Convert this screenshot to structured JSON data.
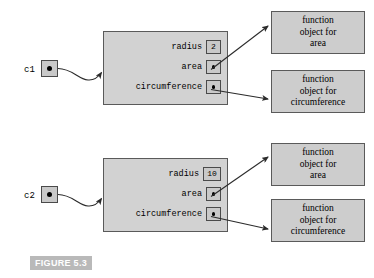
{
  "figure": {
    "caption": "FIGURE 5.3",
    "colors": {
      "object_box_fill": "#d2d2d2",
      "function_box_fill": "#cdcdcd",
      "slot_fill": "#c9c9c9",
      "border": "#5a5a5a",
      "caption_band": "#b9b9b9",
      "caption_text": "#ffffff",
      "line": "#2b2b2b",
      "dot": "#000000"
    }
  },
  "instances": [
    {
      "variable": "c1",
      "attributes": [
        {
          "name": "radius",
          "kind": "value",
          "value": "2"
        },
        {
          "name": "area",
          "kind": "pointer",
          "value": ""
        },
        {
          "name": "circumference",
          "kind": "pointer",
          "value": ""
        }
      ],
      "functions": [
        {
          "lines": [
            "function",
            "object for",
            "area"
          ]
        },
        {
          "lines": [
            "function",
            "object for",
            "circumference"
          ]
        }
      ]
    },
    {
      "variable": "c2",
      "attributes": [
        {
          "name": "radius",
          "kind": "value",
          "value": "10"
        },
        {
          "name": "area",
          "kind": "pointer",
          "value": ""
        },
        {
          "name": "circumference",
          "kind": "pointer",
          "value": ""
        }
      ],
      "functions": [
        {
          "lines": [
            "function",
            "object for",
            "area"
          ]
        },
        {
          "lines": [
            "function",
            "object for",
            "circumference"
          ]
        }
      ]
    }
  ]
}
